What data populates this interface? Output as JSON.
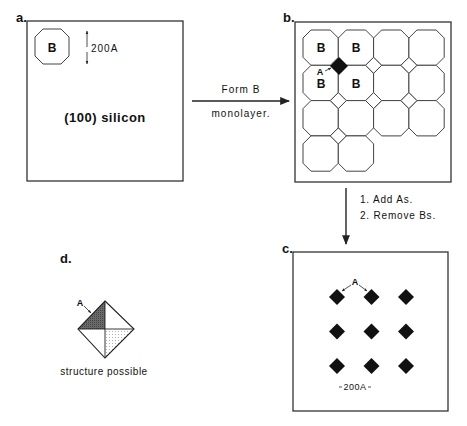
{
  "panels": {
    "a": {
      "label": "a.",
      "octagon_text": "B",
      "scale_text": "200A",
      "substrate_text": "(100)  silicon"
    },
    "b": {
      "label": "b.",
      "grid_rows": [
        4,
        4,
        4,
        2
      ],
      "b_labels": [
        "B",
        "B",
        "B",
        "B"
      ],
      "a_label": "A"
    },
    "c": {
      "label": "c.",
      "a_label": "A",
      "scale_text": "200A",
      "dot_rows": 3,
      "dot_cols": 3
    },
    "d": {
      "label": "d.",
      "a_label": "A",
      "caption": "structure  possible"
    }
  },
  "steps": {
    "a_to_b": {
      "line1": "Form  B",
      "line2": "monolayer."
    },
    "b_to_c": {
      "line1": "1.  Add  As.",
      "line2": "2.  Remove  Bs."
    }
  }
}
